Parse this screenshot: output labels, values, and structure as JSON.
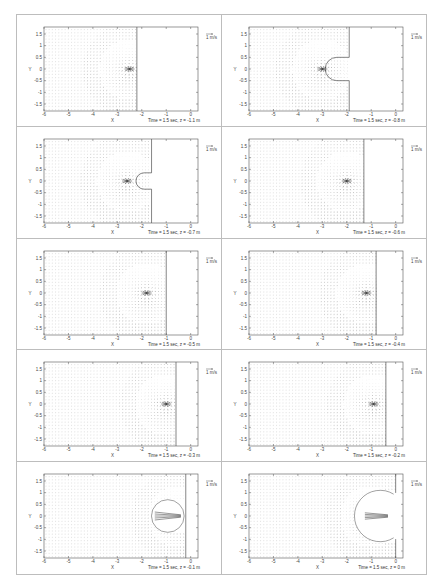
{
  "figure": {
    "layout": {
      "rows": 5,
      "cols": 2
    },
    "reference_arrow_label": "1 m/s",
    "xlabel": "X",
    "ylabel": "Y",
    "x_ticks": [
      "-6",
      "-5",
      "-4",
      "-3",
      "-2",
      "-1",
      "0"
    ],
    "y_ticks": [
      "1.5",
      "1",
      "0.5",
      "0",
      "-0.5",
      "-1",
      "-1.5"
    ],
    "colors": {
      "frame": "#555555",
      "vector": "#9a9a9a",
      "dense_vector": "#333333",
      "cell_border": "#bdbdbd"
    }
  },
  "panels": [
    {
      "caption": "Time = 1.5 sec, z = -1.1 m"
    },
    {
      "caption": "Time = 1.5 sec, z = -0.8 m"
    },
    {
      "caption": "Time = 1.5 sec, z = -0.7 m"
    },
    {
      "caption": "Time = 1.5 sec, z = -0.6 m"
    },
    {
      "caption": "Time = 1.5 sec, z = -0.5 m"
    },
    {
      "caption": "Time = 1.5 sec, z = -0.4 m"
    },
    {
      "caption": "Time = 1.5 sec, z = -0.3 m"
    },
    {
      "caption": "Time = 1.5 sec, z = -0.2 m"
    },
    {
      "caption": "Time = 1.5 sec, z = -0.1 m"
    },
    {
      "caption": "Time = 1.5 sec, z = 0 m"
    }
  ],
  "chart_data": [
    {
      "type": "quiver",
      "title": "Time = 1.5 sec, z = -1.1 m",
      "xlabel": "X",
      "ylabel": "Y",
      "xlim": [
        -6,
        0.3
      ],
      "ylim": [
        -1.8,
        1.8
      ],
      "x_ticks": [
        -6,
        -5,
        -4,
        -3,
        -2,
        -1,
        0
      ],
      "y_ticks": [
        -1.5,
        -1,
        -0.5,
        0,
        0.5,
        1,
        1.5
      ],
      "grid": false,
      "legend": "1 m/s reference arrow (top right)",
      "features": {
        "boundary_x": -2.2,
        "boundary_shape": "vertical line",
        "focus": {
          "x": -2.5,
          "y": 0
        },
        "cavity_radius": 0
      }
    },
    {
      "type": "quiver",
      "title": "Time = 1.5 sec, z = -0.8 m",
      "xlabel": "X",
      "ylabel": "Y",
      "xlim": [
        -6,
        0.3
      ],
      "ylim": [
        -1.8,
        1.8
      ],
      "x_ticks": [
        -6,
        -5,
        -4,
        -3,
        -2,
        -1,
        0
      ],
      "y_ticks": [
        -1.5,
        -1,
        -0.5,
        0,
        0.5,
        1,
        1.5
      ],
      "grid": false,
      "legend": "1 m/s reference arrow (top right)",
      "features": {
        "boundary_x": -1.9,
        "boundary_shape": "vertical line with semicircular notch",
        "focus": {
          "x": -3.0,
          "y": 0
        },
        "cavity_radius": 0.5
      }
    },
    {
      "type": "quiver",
      "title": "Time = 1.5 sec, z = -0.7 m",
      "xlabel": "X",
      "ylabel": "Y",
      "xlim": [
        -6,
        0.3
      ],
      "ylim": [
        -1.8,
        1.8
      ],
      "x_ticks": [
        -6,
        -5,
        -4,
        -3,
        -2,
        -1,
        0
      ],
      "y_ticks": [
        -1.5,
        -1,
        -0.5,
        0,
        0.5,
        1,
        1.5
      ],
      "grid": false,
      "legend": "1 m/s reference arrow (top right)",
      "features": {
        "boundary_x": -1.6,
        "boundary_shape": "vertical line with notch",
        "focus": {
          "x": -2.6,
          "y": 0
        },
        "cavity_radius": 0.35
      }
    },
    {
      "type": "quiver",
      "title": "Time = 1.5 sec, z = -0.6 m",
      "xlabel": "X",
      "ylabel": "Y",
      "xlim": [
        -6,
        0.3
      ],
      "ylim": [
        -1.8,
        1.8
      ],
      "x_ticks": [
        -6,
        -5,
        -4,
        -3,
        -2,
        -1,
        0
      ],
      "y_ticks": [
        -1.5,
        -1,
        -0.5,
        0,
        0.5,
        1,
        1.5
      ],
      "grid": false,
      "legend": "1 m/s reference arrow (top right)",
      "features": {
        "boundary_x": -1.3,
        "boundary_shape": "vertical line",
        "focus": {
          "x": -2.0,
          "y": 0
        },
        "cavity_radius": 0
      }
    },
    {
      "type": "quiver",
      "title": "Time = 1.5 sec, z = -0.5 m",
      "xlabel": "X",
      "ylabel": "Y",
      "xlim": [
        -6,
        0.3
      ],
      "ylim": [
        -1.8,
        1.8
      ],
      "x_ticks": [
        -6,
        -5,
        -4,
        -3,
        -2,
        -1,
        0
      ],
      "y_ticks": [
        -1.5,
        -1,
        -0.5,
        0,
        0.5,
        1,
        1.5
      ],
      "grid": false,
      "legend": "1 m/s reference arrow (top right)",
      "features": {
        "boundary_x": -1.0,
        "boundary_shape": "vertical line",
        "focus": {
          "x": -1.8,
          "y": 0
        },
        "cavity_radius": 0
      }
    },
    {
      "type": "quiver",
      "title": "Time = 1.5 sec, z = -0.4 m",
      "xlabel": "X",
      "ylabel": "Y",
      "xlim": [
        -6,
        0.3
      ],
      "ylim": [
        -1.8,
        1.8
      ],
      "x_ticks": [
        -6,
        -5,
        -4,
        -3,
        -2,
        -1,
        0
      ],
      "y_ticks": [
        -1.5,
        -1,
        -0.5,
        0,
        0.5,
        1,
        1.5
      ],
      "grid": false,
      "legend": "1 m/s reference arrow (top right)",
      "features": {
        "boundary_x": -0.8,
        "boundary_shape": "vertical line",
        "focus": {
          "x": -1.2,
          "y": 0
        },
        "cavity_radius": 0
      }
    },
    {
      "type": "quiver",
      "title": "Time = 1.5 sec, z = -0.3 m",
      "xlabel": "X",
      "ylabel": "Y",
      "xlim": [
        -6,
        0.3
      ],
      "ylim": [
        -1.8,
        1.8
      ],
      "x_ticks": [
        -6,
        -5,
        -4,
        -3,
        -2,
        -1,
        0
      ],
      "y_ticks": [
        -1.5,
        -1,
        -0.5,
        0,
        0.5,
        1,
        1.5
      ],
      "grid": false,
      "legend": "1 m/s reference arrow (top right)",
      "features": {
        "boundary_x": -0.6,
        "boundary_shape": "vertical line",
        "focus": {
          "x": -1.0,
          "y": 0
        },
        "cavity_radius": 0
      }
    },
    {
      "type": "quiver",
      "title": "Time = 1.5 sec, z = -0.2 m",
      "xlabel": "X",
      "ylabel": "Y",
      "xlim": [
        -6,
        0.3
      ],
      "ylim": [
        -1.8,
        1.8
      ],
      "x_ticks": [
        -6,
        -5,
        -4,
        -3,
        -2,
        -1,
        0
      ],
      "y_ticks": [
        -1.5,
        -1,
        -0.5,
        0,
        0.5,
        1,
        1.5
      ],
      "grid": false,
      "legend": "1 m/s reference arrow (top right)",
      "features": {
        "boundary_x": -0.4,
        "boundary_shape": "vertical line",
        "focus": {
          "x": -0.9,
          "y": 0
        },
        "cavity_radius": 0
      }
    },
    {
      "type": "quiver",
      "title": "Time = 1.5 sec, z = -0.1 m",
      "xlabel": "X",
      "ylabel": "Y",
      "xlim": [
        -6,
        0.3
      ],
      "ylim": [
        -1.8,
        1.8
      ],
      "x_ticks": [
        -6,
        -5,
        -4,
        -3,
        -2,
        -1,
        0
      ],
      "y_ticks": [
        -1.5,
        -1,
        -0.5,
        0,
        0.5,
        1,
        1.5
      ],
      "grid": false,
      "legend": "1 m/s reference arrow (top right)",
      "features": {
        "boundary_x": -0.2,
        "boundary_shape": "vertical line with circular cavity",
        "focus": {
          "x": -0.5,
          "y": 0
        },
        "cavity_radius": 0.7
      }
    },
    {
      "type": "quiver",
      "title": "Time = 1.5 sec, z = 0 m",
      "xlabel": "X",
      "ylabel": "Y",
      "xlim": [
        -6,
        0.3
      ],
      "ylim": [
        -1.8,
        1.8
      ],
      "x_ticks": [
        -6,
        -5,
        -4,
        -3,
        -2,
        -1,
        0
      ],
      "y_ticks": [
        -1.5,
        -1,
        -0.5,
        0,
        0.5,
        1,
        1.5
      ],
      "grid": false,
      "legend": "1 m/s reference arrow (top right)",
      "features": {
        "boundary_x": 0.0,
        "boundary_shape": "C-shaped cavity",
        "focus": {
          "x": -1.0,
          "y": 0
        },
        "cavity_radius": 1.1
      }
    }
  ]
}
